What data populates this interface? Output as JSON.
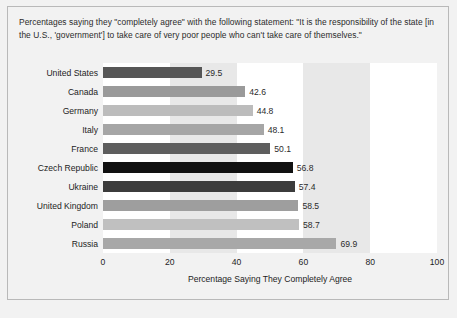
{
  "figure": {
    "title": "Percentages saying they \"completely agree\" with the following statement: \"It is the responsibility of the state [in the U.S., 'government'] to take care of very poor people who can't take care of themselves.\"",
    "footnote": ""
  },
  "chart_data": {
    "type": "bar",
    "orientation": "horizontal",
    "title": "Percentages saying they \"completely agree\" with the following statement: \"It is the responsibility of the state [in the U.S., 'government'] to take care of very poor people who can't take care of themselves.\"",
    "xlabel": "Percentage Saying They Completely Agree",
    "ylabel": "",
    "xlim": [
      0,
      100
    ],
    "xticks": [
      0,
      20,
      40,
      60,
      80,
      100
    ],
    "xtick_labels": [
      "0",
      "20",
      "40",
      "60",
      "80",
      "100"
    ],
    "grid": false,
    "banding": "alternating vertical gray bands every 20 units",
    "legend": "none",
    "categories": [
      "United States",
      "Canada",
      "Germany",
      "Italy",
      "France",
      "Czech Republic",
      "Ukraine",
      "United Kingdom",
      "Poland",
      "Russia"
    ],
    "values": [
      29.5,
      42.6,
      44.8,
      48.1,
      50.1,
      56.8,
      57.4,
      58.5,
      58.7,
      69.9
    ],
    "value_labels": [
      "29.5",
      "42.6",
      "44.8",
      "48.1",
      "50.1",
      "56.8",
      "57.4",
      "58.5",
      "58.7",
      "69.9"
    ],
    "bar_colors": [
      "#565656",
      "#9a9a9a",
      "#bcbcbc",
      "#a6a6a6",
      "#5e5e5e",
      "#111111",
      "#3c3c3c",
      "#9e9e9e",
      "#c0c0c0",
      "#a8a8a8"
    ]
  },
  "colors": {
    "figure_background": "#f2f2f2",
    "plot_background": "#ffffff",
    "band_color": "#e8e8e8",
    "frame_border": "#b9b9b9",
    "text": "#1d1d1d"
  }
}
